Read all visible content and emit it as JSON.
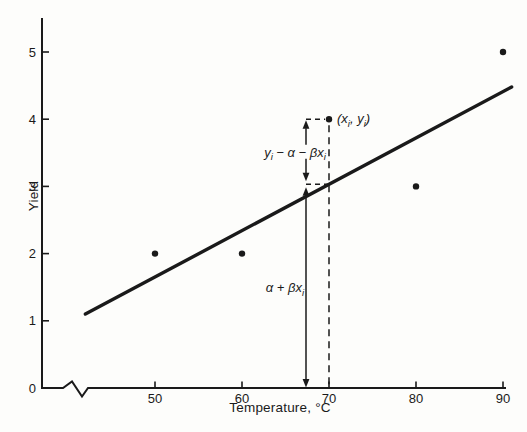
{
  "colors": {
    "ink": "#1a1a1a",
    "background": "#fdfdfb"
  },
  "chart_data": {
    "type": "scatter",
    "title": "",
    "xlabel": "Temperature, °C",
    "ylabel": "Yield",
    "x_ticks": [
      50,
      60,
      70,
      80,
      90
    ],
    "y_ticks": [
      0,
      1,
      2,
      3,
      4,
      5
    ],
    "ylim": [
      0,
      5.5
    ],
    "x_axis_break": true,
    "grid": false,
    "points": [
      {
        "x": 50,
        "y": 2
      },
      {
        "x": 60,
        "y": 2
      },
      {
        "x": 70,
        "y": 4
      },
      {
        "x": 80,
        "y": 3
      },
      {
        "x": 90,
        "y": 5
      }
    ],
    "highlighted_point": {
      "x": 70,
      "y": 4
    },
    "regression_line": {
      "x1": 42,
      "y1": 1.1,
      "x2": 91,
      "y2": 4.48
    },
    "annotations": {
      "point_label": {
        "plain": "(xi, yi)",
        "segments": [
          {
            "t": "(x"
          },
          {
            "t": "i",
            "sub": true
          },
          {
            "t": ", y"
          },
          {
            "t": "i",
            "sub": true
          },
          {
            "t": ")"
          }
        ]
      },
      "residual_label": {
        "plain": "yi − α − βxi",
        "segments": [
          {
            "t": "y"
          },
          {
            "t": "i",
            "sub": true
          },
          {
            "t": " − α − βx"
          },
          {
            "t": "i",
            "sub": true
          }
        ]
      },
      "fitted_label": {
        "plain": "α + βxi",
        "segments": [
          {
            "t": "α + βx"
          },
          {
            "t": "i",
            "sub": true
          }
        ]
      }
    }
  }
}
